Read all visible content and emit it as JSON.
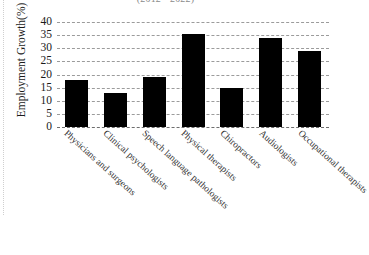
{
  "chart_data": {
    "type": "bar",
    "title": "(2012 - 2022)",
    "xlabel": "",
    "ylabel": "Employment Growth(%)",
    "categories": [
      "Physicians and surgeons",
      "Clinical psychologists",
      "Speech language pathologists",
      "Physical therapists",
      "Chiropractors",
      "Audiologists",
      "Occupational therapists"
    ],
    "values": [
      18,
      13,
      19,
      35.5,
      15,
      34,
      29
    ],
    "ylim": [
      0,
      40
    ],
    "yticks": [
      0,
      5,
      10,
      15,
      20,
      25,
      30,
      35,
      40
    ],
    "ytick_labels": [
      "0",
      "5",
      "10",
      "15",
      "20",
      "25",
      "30",
      "35",
      "40"
    ],
    "grid": true,
    "grid_style": "dashed",
    "legend": null,
    "bar_color": "#000000",
    "grid_color": "#9b9b9b",
    "background_color": "#ffffff"
  }
}
